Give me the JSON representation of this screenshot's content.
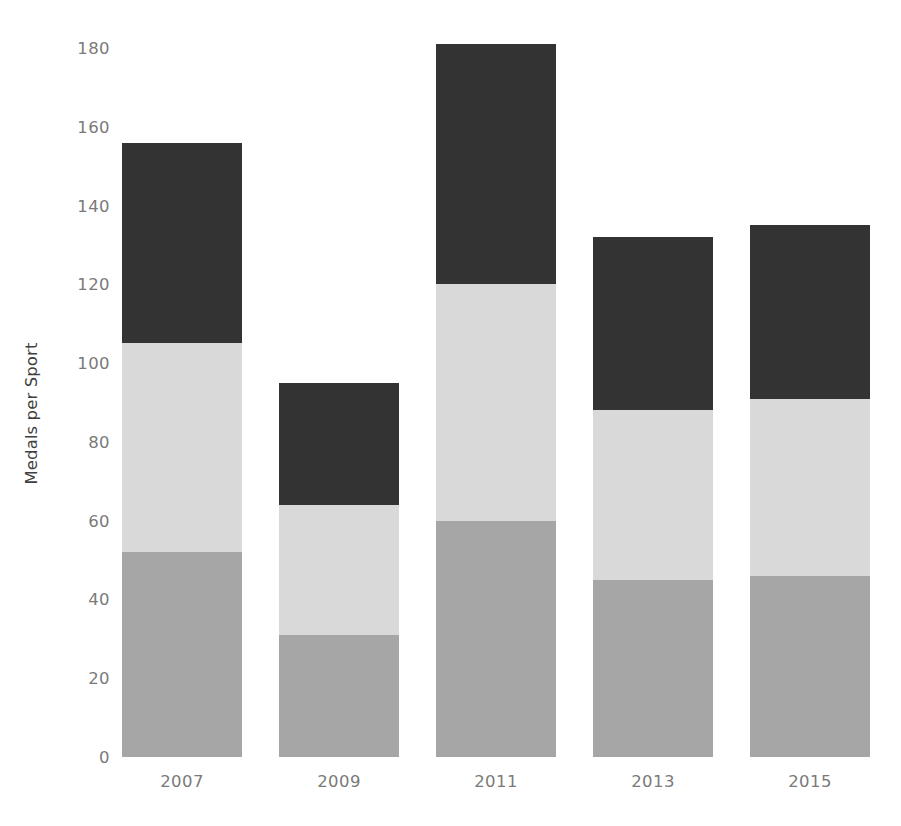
{
  "chart_data": {
    "type": "bar",
    "subtype": "stacked-bar",
    "title": "",
    "xlabel": "",
    "ylabel": "Medals per Sport",
    "categories": [
      "2007",
      "2009",
      "2011",
      "2013",
      "2015"
    ],
    "ylim": [
      0,
      180
    ],
    "yticks": [
      0,
      20,
      40,
      60,
      80,
      100,
      120,
      140,
      160,
      180
    ],
    "ytick_labels": [
      "0",
      "20",
      "40",
      "60",
      "80",
      "100",
      "120",
      "140",
      "160",
      "180"
    ],
    "grid": false,
    "legend": "none",
    "series": [
      {
        "name": "bottom-segment",
        "color": "#a6a6a6",
        "values": [
          52,
          31,
          60,
          45,
          46
        ]
      },
      {
        "name": "middle-segment",
        "color": "#d9d9d9",
        "values": [
          53,
          33,
          60,
          43,
          45
        ]
      },
      {
        "name": "top-segment",
        "color": "#333333",
        "values": [
          51,
          31,
          61,
          44,
          44
        ]
      }
    ],
    "totals": [
      156,
      95,
      181,
      132,
      135
    ]
  },
  "colors": {
    "background": "#ffffff",
    "segment_bottom": "#a6a6a6",
    "segment_middle": "#d9d9d9",
    "segment_top": "#333333",
    "tick_label": "#7a7a7a",
    "axis_title": "#3f3f3f"
  }
}
